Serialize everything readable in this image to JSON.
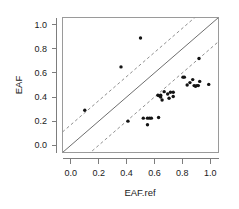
{
  "figure": {
    "background_color": "#ffffff",
    "point_color": "#141414",
    "solid_line_color": "#6e6e6e",
    "dashed_line_color": "#8f8f8f",
    "frame_color": "#9a9a9a"
  },
  "axes": {
    "x_title": "EAF.ref",
    "y_title": "EAF",
    "x_ticks": [
      "0.0",
      "0.2",
      "0.4",
      "0.6",
      "0.8",
      "1.0"
    ],
    "y_ticks": [
      "0.0",
      "0.2",
      "0.4",
      "0.6",
      "0.8",
      "1.0"
    ]
  },
  "chart_data": {
    "type": "scatter",
    "title": "",
    "xlabel": "EAF.ref",
    "ylabel": "EAF",
    "xlim": [
      -0.06,
      1.06
    ],
    "ylim": [
      -0.06,
      1.06
    ],
    "xticks": [
      0.0,
      0.2,
      0.4,
      0.6,
      0.8,
      1.0
    ],
    "yticks": [
      0.0,
      0.2,
      0.4,
      0.6,
      0.8,
      1.0
    ],
    "grid": false,
    "legend": null,
    "series": [
      {
        "name": "EAF vs EAF.ref",
        "marker": "filled-circle",
        "color": "#141414",
        "points": [
          [
            0.1,
            0.29
          ],
          [
            0.36,
            0.65
          ],
          [
            0.5,
            0.89
          ],
          [
            0.41,
            0.2
          ],
          [
            0.52,
            0.225
          ],
          [
            0.55,
            0.225
          ],
          [
            0.565,
            0.225
          ],
          [
            0.578,
            0.225
          ],
          [
            0.55,
            0.17
          ],
          [
            0.63,
            0.23
          ],
          [
            0.625,
            0.415
          ],
          [
            0.635,
            0.41
          ],
          [
            0.645,
            0.415
          ],
          [
            0.645,
            0.4
          ],
          [
            0.655,
            0.375
          ],
          [
            0.67,
            0.445
          ],
          [
            0.695,
            0.425
          ],
          [
            0.705,
            0.39
          ],
          [
            0.715,
            0.44
          ],
          [
            0.735,
            0.44
          ],
          [
            0.735,
            0.405
          ],
          [
            0.805,
            0.565
          ],
          [
            0.815,
            0.565
          ],
          [
            0.835,
            0.5
          ],
          [
            0.855,
            0.52
          ],
          [
            0.875,
            0.545
          ],
          [
            0.885,
            0.495
          ],
          [
            0.895,
            0.49
          ],
          [
            0.905,
            0.495
          ],
          [
            0.915,
            0.495
          ],
          [
            0.92,
            0.72
          ],
          [
            0.925,
            0.53
          ],
          [
            0.99,
            0.505
          ]
        ]
      }
    ],
    "reference_lines": [
      {
        "name": "identity",
        "style": "solid",
        "slope": 1,
        "intercept": 0
      },
      {
        "name": "upper-band",
        "style": "dashed",
        "slope": 1,
        "intercept": 0.17
      },
      {
        "name": "lower-band",
        "style": "dashed",
        "slope": 1,
        "intercept": -0.2
      }
    ]
  }
}
